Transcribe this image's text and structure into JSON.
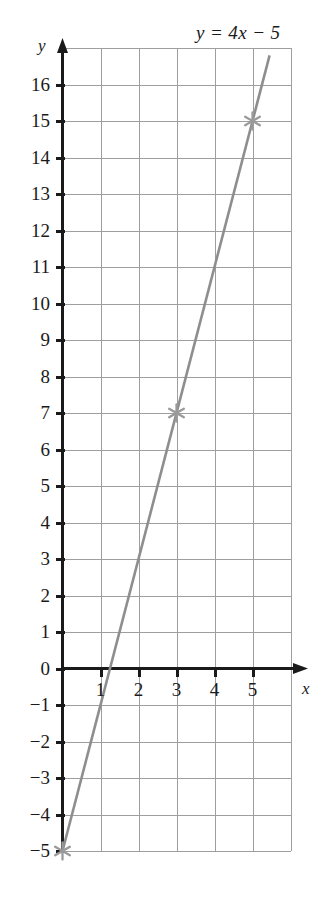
{
  "chart_data": {
    "type": "line",
    "title": "y = 4x − 5",
    "equation": "y = 4x − 5",
    "xlabel": "x",
    "ylabel": "y",
    "xlim": [
      -0.2,
      6
    ],
    "ylim": [
      -5,
      17
    ],
    "grid": true,
    "grid_step_x": 1,
    "grid_step_y": 1,
    "legend": false,
    "slope": 4,
    "intercept": -5,
    "x_ticks": [
      1,
      2,
      3,
      4,
      5
    ],
    "x_tick_labels": [
      "1",
      "2",
      "3",
      "4",
      "5"
    ],
    "y_ticks": [
      16,
      15,
      14,
      13,
      12,
      11,
      10,
      9,
      8,
      7,
      6,
      5,
      4,
      3,
      2,
      1,
      0,
      -1,
      -2,
      -3,
      -4,
      -5
    ],
    "y_tick_labels": [
      "16",
      "15",
      "14",
      "13",
      "12",
      "11",
      "10",
      "9",
      "8",
      "7",
      "6",
      "5",
      "4",
      "3",
      "2",
      "1",
      "0",
      "−1",
      "−2",
      "−3",
      "−4",
      "−5"
    ],
    "series": [
      {
        "name": "y = 4x − 5",
        "line_color": "#8e8e8e",
        "x": [
          0,
          5.45
        ],
        "y": [
          -5,
          16.8
        ]
      }
    ],
    "marked_points": [
      {
        "x": 0,
        "y": -5,
        "marker": "star",
        "color": "#9a9a9a"
      },
      {
        "x": 3,
        "y": 7,
        "marker": "star",
        "color": "#9a9a9a"
      },
      {
        "x": 5,
        "y": 15,
        "marker": "star",
        "color": "#9a9a9a"
      }
    ],
    "colors": {
      "axis": "#1a1a1a",
      "grid": "#9e9e9e",
      "line": "#8e8e8e",
      "marker": "#9a9a9a",
      "background": "#ffffff",
      "text": "#1a1a1a"
    }
  }
}
